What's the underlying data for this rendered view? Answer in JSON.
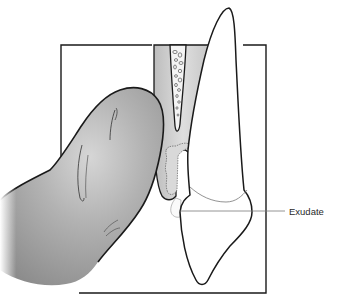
{
  "figure": {
    "labels": [
      {
        "id": "exudate",
        "text": "Exudate"
      }
    ]
  },
  "colors": {
    "background": "#ffffff",
    "outline": "#1a1a1a",
    "finger_fill": "#a9a9a9",
    "finger_highlight": "#d4d4d4",
    "gingiva_fill": "#cfcfcf",
    "bone_fill": "#f2f2f2",
    "tooth_fill": "#ffffff",
    "leader_line": "#7a7a7a"
  }
}
